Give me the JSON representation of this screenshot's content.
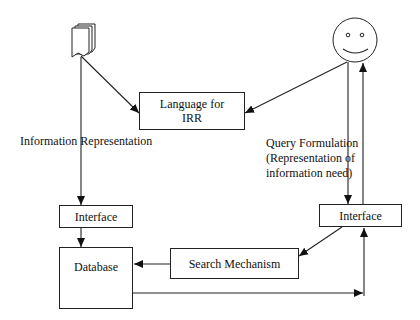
{
  "diagram": {
    "nodes": {
      "documents": {
        "icon": "document-stack-icon"
      },
      "user": {
        "icon": "smiley-face-icon"
      },
      "language": {
        "label": "Language for\nIRR",
        "line1": "Language for",
        "line2": "IRR"
      },
      "interface_left": {
        "label": "Interface"
      },
      "interface_right": {
        "label": "Interface"
      },
      "database": {
        "label": "Database"
      },
      "search": {
        "label": "Search Mechanism"
      }
    },
    "labels": {
      "info_rep": "Information Representation",
      "query_line1": "Query Formulation",
      "query_line2": "(Representation of",
      "query_line3": "information need)"
    },
    "edges": [
      {
        "from": "documents",
        "to": "language"
      },
      {
        "from": "documents",
        "to": "interface_left",
        "label": "Information Representation"
      },
      {
        "from": "user",
        "to": "language"
      },
      {
        "from": "user",
        "to": "interface_right",
        "label": "Query Formulation (Representation of information need)"
      },
      {
        "from": "interface_right",
        "to": "user"
      },
      {
        "from": "interface_left",
        "to": "database"
      },
      {
        "from": "interface_right",
        "to": "search"
      },
      {
        "from": "search",
        "to": "database"
      },
      {
        "from": "database",
        "to": "interface_right"
      }
    ],
    "colors": {
      "stroke": "#222222",
      "background": "#ffffff"
    }
  }
}
